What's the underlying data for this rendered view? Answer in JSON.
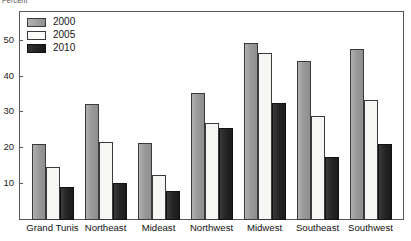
{
  "top_caption": "Percent",
  "chart_data": {
    "type": "bar",
    "title": "",
    "subtitle": "",
    "xlabel": "",
    "ylabel": "Percent",
    "ylim": [
      0,
      58
    ],
    "yticks": [
      10,
      20,
      30,
      40,
      50
    ],
    "ytick_labels": [
      "10",
      "20",
      "30",
      "40",
      "50"
    ],
    "grid": false,
    "legend_position": "top-left-inside",
    "categories": [
      "Grand Tunis",
      "Northeast",
      "Mideast",
      "Northwest",
      "Midwest",
      "Southeast",
      "Southwest"
    ],
    "series": [
      {
        "name": "2000",
        "color": "#9a9a9a",
        "values": [
          21.2,
          32.3,
          21.5,
          35.4,
          49.3,
          44.4,
          47.8
        ]
      },
      {
        "name": "2005",
        "color": "#f6f6f4",
        "values": [
          14.7,
          21.7,
          12.5,
          27.0,
          46.6,
          29.1,
          33.4
        ]
      },
      {
        "name": "2010",
        "color": "#1e1e1e",
        "values": [
          9.2,
          10.4,
          8.0,
          25.7,
          32.5,
          17.6,
          21.3
        ]
      }
    ]
  },
  "legend": {
    "items": [
      {
        "label": "2000"
      },
      {
        "label": "2005"
      },
      {
        "label": "2010"
      }
    ]
  },
  "colors": {
    "series_2000": "#9a9a9a",
    "series_2005": "#f6f6f4",
    "series_2010": "#1e1e1e",
    "frame": "#55595c",
    "text": "#161616",
    "background": "#ffffff"
  }
}
